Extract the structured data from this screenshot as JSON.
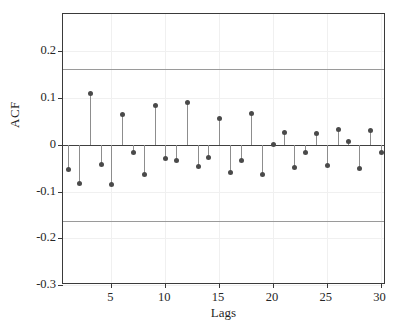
{
  "figure": {
    "background": "#ffffff",
    "axis_color": "#3a3a3a",
    "stem_color": "#8d8d8d",
    "marker_color": "#4a4a4a",
    "confidence_color": "#9a9a9a",
    "grid_color": "#f0f0f0"
  },
  "axes": {
    "y_title": "ACF",
    "x_title": "Lags",
    "y_ticks": [
      "0.2",
      "0.1",
      "0",
      "-0.1",
      "-0.2",
      "-0.3"
    ],
    "y_tick_values": [
      0.2,
      0.1,
      0,
      -0.1,
      -0.2,
      -0.3
    ],
    "x_ticks": [
      "5",
      "10",
      "15",
      "20",
      "25",
      "30"
    ],
    "x_tick_values": [
      5,
      10,
      15,
      20,
      25,
      30
    ]
  },
  "chart_data": {
    "type": "bar",
    "title": "",
    "subtitle": "",
    "xlabel": "Lags",
    "ylabel": "ACF",
    "xlim": [
      0.5,
      30.5
    ],
    "ylim": [
      -0.3,
      0.28
    ],
    "grid": true,
    "legend": null,
    "categories": [
      1,
      2,
      3,
      4,
      5,
      6,
      7,
      8,
      9,
      10,
      11,
      12,
      13,
      14,
      15,
      16,
      17,
      18,
      19,
      20,
      21,
      22,
      23,
      24,
      25,
      26,
      27,
      28,
      29,
      30
    ],
    "values": [
      -0.052,
      -0.082,
      0.111,
      -0.042,
      -0.083,
      0.065,
      -0.016,
      -0.063,
      0.086,
      -0.029,
      -0.033,
      0.091,
      -0.045,
      -0.026,
      0.058,
      -0.059,
      -0.032,
      0.068,
      -0.062,
      0.002,
      0.027,
      -0.048,
      -0.016,
      0.026,
      -0.044,
      0.033,
      0.009,
      -0.05,
      0.032,
      -0.016
    ],
    "series": [
      {
        "name": "Sample Autocorrelation",
        "values": [
          -0.052,
          -0.082,
          0.111,
          -0.042,
          -0.083,
          0.065,
          -0.016,
          -0.063,
          0.086,
          -0.029,
          -0.033,
          0.091,
          -0.045,
          -0.026,
          0.058,
          -0.059,
          -0.032,
          0.068,
          -0.062,
          0.002,
          0.027,
          -0.048,
          -0.016,
          0.026,
          -0.044,
          0.033,
          0.009,
          -0.05,
          0.032,
          -0.016
        ]
      }
    ],
    "confidence_bounds": {
      "upper": 0.162,
      "lower": -0.162,
      "label": "Approximate 95% confidence bounds"
    },
    "annotations": []
  }
}
